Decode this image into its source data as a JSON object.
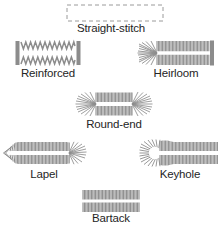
{
  "diagram": {
    "stitch_color": "#8c8c8c",
    "stitch_color_light": "#a8a8a8",
    "label_color": "#252525",
    "background": "#ffffff",
    "figures": [
      {
        "id": "straight-stitch",
        "label": "Straight-stitch",
        "shape": "dashed-rectangle",
        "description": "dashed outline rectangle, no stitching"
      },
      {
        "id": "reinforced",
        "label": "Reinforced",
        "shape": "zigzag-rows-with-bar-tacks",
        "description": "two zigzag stitch rows with solid vertical bars at both ends"
      },
      {
        "id": "heirloom",
        "label": "Heirloom",
        "shape": "fan-end-with-bar-tack",
        "description": "radiating fan at left end, dense comb rows, solid bar at right end"
      },
      {
        "id": "round-end",
        "label": "Round-end",
        "shape": "fan-both-ends",
        "description": "radiating fans at both ends with dense comb rows"
      },
      {
        "id": "lapel",
        "label": "Lapel",
        "shape": "tapered-point-and-fan",
        "description": "tapered pointed left end, comb rows, fan burst at right end"
      },
      {
        "id": "keyhole",
        "label": "Keyhole",
        "shape": "eyelet-with-comb",
        "description": "round eyelet hole at left with radiating fan, comb rows to the right"
      },
      {
        "id": "bartack",
        "label": "Bartack",
        "shape": "rectangular-comb",
        "description": "rectangular dense comb rows with flat squared ends"
      }
    ],
    "footer_clipped_text": ""
  }
}
